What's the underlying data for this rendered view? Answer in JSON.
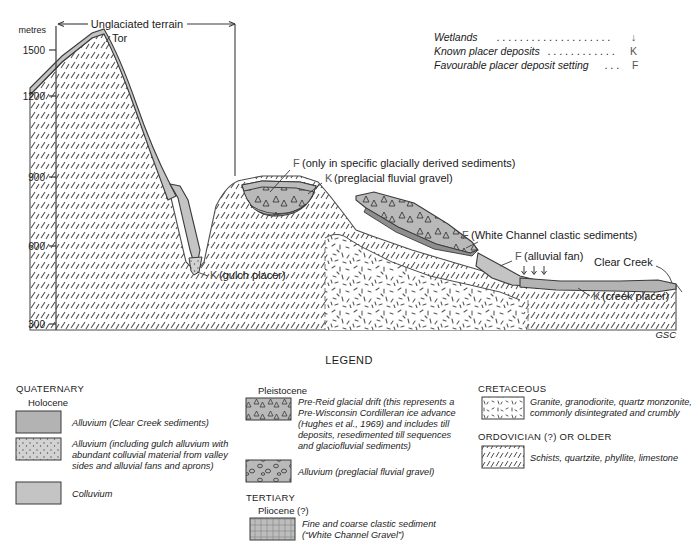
{
  "figure": {
    "axis": {
      "unit_label": "metres",
      "ticks": [
        "1500",
        "1200",
        "900",
        "600",
        "300"
      ]
    },
    "bracket_label": "Unglaciated terrain",
    "peak_label": "Tor",
    "credit": "GSC",
    "key": [
      {
        "text": "Wetlands",
        "dots": ". . . . . . . . . . . . . . . . . . . .",
        "code": "↓"
      },
      {
        "text": "Known placer deposits",
        "dots": ". . . . . . . . . . . .",
        "code": "K"
      },
      {
        "text": "Favourable placer deposit setting",
        "dots": ". . .",
        "code": "F"
      }
    ],
    "annotations": [
      {
        "code": "F",
        "text": "(only in specific glacially derived sediments)"
      },
      {
        "code": "K",
        "text": "(preglacial fluvial gravel)"
      },
      {
        "code": "F",
        "text": "(White Channel clastic sediments)"
      },
      {
        "code": "F",
        "text": "(alluvial fan)"
      },
      {
        "code": "K",
        "text": "(gulch placer)"
      },
      {
        "code": "K",
        "text": "(creek placer)"
      }
    ],
    "creek_label": "Clear Creek"
  },
  "legend": {
    "title": "LEGEND",
    "columns": [
      {
        "era": "QUATERNARY",
        "groups": [
          {
            "epoch": "Holocene",
            "items": [
              {
                "swatch": "alluvium-clear-creek",
                "lines": [
                  "Alluvium (Clear Creek sediments)"
                ]
              },
              {
                "swatch": "alluvium-gulch",
                "lines": [
                  "Alluvium (including gulch alluvium with",
                  "abundant colluvial material from valley",
                  "sides and alluvial fans and aprons)"
                ]
              },
              {
                "swatch": "colluvium",
                "lines": [
                  "Colluvium"
                ]
              }
            ]
          }
        ]
      },
      {
        "era": "",
        "groups": [
          {
            "epoch": "Pleistocene",
            "items": [
              {
                "swatch": "pre-reid-drift",
                "lines": [
                  "Pre-Reid glacial drift (this represents a",
                  "Pre-Wisconsin Cordilleran ice advance",
                  "(Hughes et al., 1969) and includes till",
                  "deposits, resedimented till sequences",
                  "and glaciofluvial sediments)"
                ]
              },
              {
                "swatch": "alluvium-preglacial",
                "lines": [
                  "Alluvium (preglacial fluvial gravel)"
                ]
              }
            ]
          },
          {
            "era2": "TERTIARY",
            "epoch": "Pliocene (?)",
            "items": [
              {
                "swatch": "white-channel-gravel",
                "lines": [
                  "Fine and coarse clastic sediment",
                  "(“White Channel Gravel”)"
                ]
              }
            ]
          }
        ]
      },
      {
        "era": "CRETACEOUS",
        "groups": [
          {
            "epoch": "",
            "items": [
              {
                "swatch": "granite",
                "lines": [
                  "Granite, granodiorite, quartz monzonite,",
                  "commonly disintegrated and crumbly"
                ]
              }
            ]
          },
          {
            "era2": "ORDOVICIAN (?) OR OLDER",
            "epoch": "",
            "items": [
              {
                "swatch": "schist",
                "lines": [
                  "Schists, quartzite, phyllite, limestone"
                ]
              }
            ]
          }
        ]
      }
    ]
  },
  "colors": {
    "gray_fill": "#b9b9b9",
    "light_gray": "#c9c9c9",
    "line": "#3a3a3a",
    "code_gray": "#55565a",
    "white": "#ffffff"
  }
}
